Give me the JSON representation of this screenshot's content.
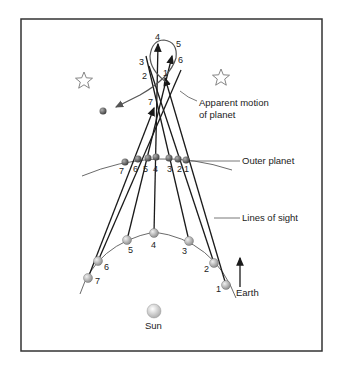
{
  "labels": {
    "apparent_motion_line1": "Apparent motion",
    "apparent_motion_line2": "of planet",
    "outer_planet": "Outer planet",
    "lines_of_sight": "Lines of sight",
    "earth": "Earth",
    "sun": "Sun"
  },
  "earth_positions": [
    {
      "n": "1",
      "x": 226,
      "y": 285
    },
    {
      "n": "2",
      "x": 214,
      "y": 263
    },
    {
      "n": "3",
      "x": 189,
      "y": 241
    },
    {
      "n": "4",
      "x": 154,
      "y": 233
    },
    {
      "n": "5",
      "x": 127,
      "y": 240
    },
    {
      "n": "6",
      "x": 98,
      "y": 261
    },
    {
      "n": "7",
      "x": 88,
      "y": 278
    }
  ],
  "outer_planet_positions": [
    {
      "n": "1",
      "x": 186,
      "y": 160
    },
    {
      "n": "2",
      "x": 178,
      "y": 159
    },
    {
      "n": "3",
      "x": 169,
      "y": 158
    },
    {
      "n": "4",
      "x": 156,
      "y": 157
    },
    {
      "n": "5",
      "x": 148,
      "y": 158
    },
    {
      "n": "6",
      "x": 138,
      "y": 159
    },
    {
      "n": "7",
      "x": 125,
      "y": 162
    }
  ],
  "apparent_positions": [
    {
      "n": "1",
      "x": 163,
      "y": 73
    },
    {
      "n": "2",
      "x": 146,
      "y": 75
    },
    {
      "n": "3",
      "x": 143,
      "y": 62
    },
    {
      "n": "4",
      "x": 158,
      "y": 36
    },
    {
      "n": "5",
      "x": 179,
      "y": 43
    },
    {
      "n": "6",
      "x": 181,
      "y": 59
    },
    {
      "n": "7",
      "x": 151,
      "y": 101
    }
  ],
  "colors": {
    "line": "#1a1a1a",
    "frame": "#333333",
    "planet": "#6e6e6e",
    "earth": "#a8a8a8",
    "sun": "#dcdcdc"
  }
}
